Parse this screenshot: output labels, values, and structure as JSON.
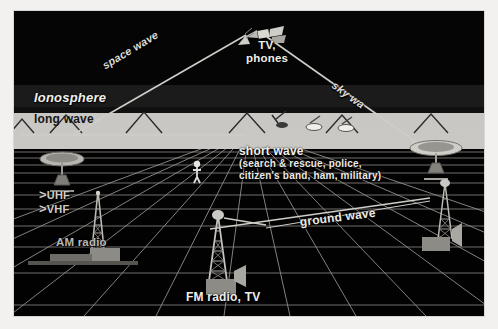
{
  "figure": {
    "kind": "radio-wave-propagation-diagram",
    "background_color": "#000000",
    "paper_color": "#f2f1ef"
  },
  "regions": {
    "sky_label": "space",
    "ionosphere_label": "Ionosphere",
    "ground_label": "earth surface grid"
  },
  "labels": {
    "space_wave": "space wave",
    "sky_wave": "sky wa",
    "ground_wave": "ground wave",
    "long_wave": "long wave",
    "short_wave": "short wave",
    "short_wave_users_line1": "(search & rescue, police,",
    "short_wave_users_line2": "citizen's band, ham, military)",
    "tv_phones_line1": "TV,",
    "tv_phones_line2": "phones",
    "ionosphere": "Ionosphere",
    "uhf": "UHF",
    "vhf": "VHF",
    "uhf_bracket": ">",
    "vhf_bracket": ">",
    "am_radio": "AM radio",
    "fm_radio_tv": "FM radio, TV"
  },
  "colors": {
    "ionosphere_band": "#c8c7c3",
    "sky": "#050505",
    "grid_line": "#9a9894",
    "ray": "#cfcdc8",
    "text": "#e9e8e4",
    "dark_text": "#151515",
    "structure": "#8d8b86"
  },
  "elements": {
    "satellite_icon": "satellite-icon",
    "dish_left": "satellite-dish-left",
    "dish_right": "satellite-dish-right",
    "tower_am": "am-radio-tower",
    "tower_fm": "fm-radio-tower",
    "tower_right": "right-radio-tower",
    "person": "person-figure",
    "mountains": "mountain-range"
  }
}
